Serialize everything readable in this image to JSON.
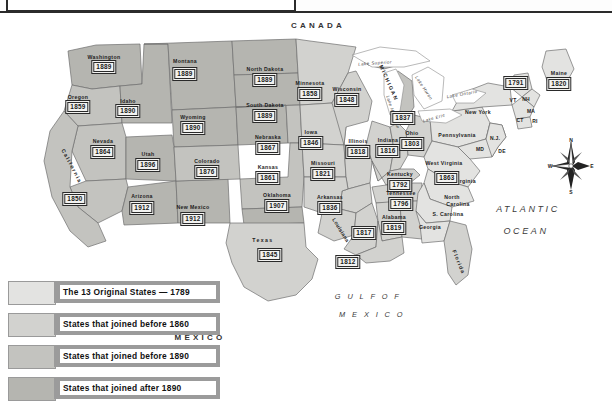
{
  "map": {
    "countries": [
      {
        "name": "CANADA",
        "x": 318,
        "y": 14
      },
      {
        "name": "MEXICO",
        "x": 200,
        "y": 326
      }
    ],
    "oceans": [
      {
        "name": "ATLANTIC",
        "x": 528,
        "y": 198
      },
      {
        "name": "OCEAN",
        "x": 526,
        "y": 220
      }
    ],
    "gulf": [
      {
        "name": "G U L F   O F",
        "x": 368,
        "y": 285
      },
      {
        "name": "M E X I C O",
        "x": 372,
        "y": 303
      }
    ],
    "lakes": [
      {
        "name": "Lake Superior",
        "x": 375,
        "y": 52,
        "rot": -4
      },
      {
        "name": "Lake Michigan",
        "x": 393,
        "y": 101,
        "rot": 72
      },
      {
        "name": "Lake Huron",
        "x": 424,
        "y": 77,
        "rot": 56
      },
      {
        "name": "Lake Erie",
        "x": 434,
        "y": 107,
        "rot": -16
      },
      {
        "name": "Lake Ontario",
        "x": 462,
        "y": 83,
        "rot": -10
      }
    ],
    "big_labels": [
      {
        "name": "MICHIGAN",
        "x": 389,
        "y": 72,
        "rot": 66
      },
      {
        "name": "California",
        "x": 72,
        "y": 155,
        "rot": 62
      },
      {
        "name": "Texas",
        "x": 263,
        "y": 229
      },
      {
        "name": "Louisiana",
        "x": 341,
        "y": 219,
        "rot": 58
      },
      {
        "name": "Florida",
        "x": 459,
        "y": 251,
        "rot": 68
      }
    ],
    "states": [
      {
        "name": "Washington",
        "date": "1889",
        "nx": 104,
        "ny": 46,
        "dx": 104,
        "dy": 56
      },
      {
        "name": "Oregon",
        "date": "1859",
        "nx": 78,
        "ny": 86,
        "dx": 78,
        "dy": 96
      },
      {
        "name": "Idaho",
        "date": "1890",
        "nx": 128,
        "ny": 90,
        "dx": 128,
        "dy": 100
      },
      {
        "name": "Montana",
        "date": "1889",
        "nx": 185,
        "ny": 50,
        "dx": 185,
        "dy": 63
      },
      {
        "name": "Wyoming",
        "date": "1890",
        "nx": 193,
        "ny": 106,
        "dx": 193,
        "dy": 117
      },
      {
        "name": "Nevada",
        "date": "1864",
        "nx": 103,
        "ny": 130,
        "dx": 103,
        "dy": 141
      },
      {
        "name": "Utah",
        "date": "1896",
        "nx": 148,
        "ny": 143,
        "dx": 148,
        "dy": 154
      },
      {
        "name": "California",
        "date": "1850",
        "nx": null,
        "ny": null,
        "dx": 75,
        "dy": 188
      },
      {
        "name": "Arizona",
        "date": "1912",
        "nx": 142,
        "ny": 185,
        "dx": 142,
        "dy": 197
      },
      {
        "name": "New Mexico",
        "date": "1912",
        "nx": 193,
        "ny": 196,
        "dx": 193,
        "dy": 208
      },
      {
        "name": "Colorado",
        "date": "1876",
        "nx": 207,
        "ny": 150,
        "dx": 207,
        "dy": 161
      },
      {
        "name": "North Dakota",
        "date": "1889",
        "nx": 265,
        "ny": 58,
        "dx": 265,
        "dy": 69
      },
      {
        "name": "South Dakota",
        "date": "1889",
        "nx": 265,
        "ny": 94,
        "dx": 265,
        "dy": 105
      },
      {
        "name": "Nebraska",
        "date": "1867",
        "nx": 268,
        "ny": 126,
        "dx": 268,
        "dy": 137
      },
      {
        "name": "Kansas",
        "date": "1861",
        "nx": 268,
        "ny": 156,
        "dx": 268,
        "dy": 167
      },
      {
        "name": "Oklahoma",
        "date": "1907",
        "nx": 277,
        "ny": 184,
        "dx": 277,
        "dy": 195
      },
      {
        "name": "Texas",
        "date": "1845",
        "nx": null,
        "ny": null,
        "dx": 270,
        "dy": 244
      },
      {
        "name": "Minnesota",
        "date": "1858",
        "nx": 310,
        "ny": 72,
        "dx": 310,
        "dy": 83
      },
      {
        "name": "Iowa",
        "date": "1846",
        "nx": 311,
        "ny": 121,
        "dx": 311,
        "dy": 132
      },
      {
        "name": "Missouri",
        "date": "1821",
        "nx": 323,
        "ny": 152,
        "dx": 323,
        "dy": 163
      },
      {
        "name": "Arkansas",
        "date": "1836",
        "nx": 330,
        "ny": 186,
        "dx": 330,
        "dy": 197
      },
      {
        "name": "Wisconsin",
        "date": "1848",
        "nx": 347,
        "ny": 78,
        "dx": 347,
        "dy": 89
      },
      {
        "name": "Illinois",
        "date": "1818",
        "nx": 358,
        "ny": 130,
        "dx": 358,
        "dy": 141
      },
      {
        "name": "Indiana",
        "date": "1816",
        "nx": 388,
        "ny": 129,
        "dx": 388,
        "dy": 140
      },
      {
        "name": "Ohio",
        "date": "1803",
        "nx": 412,
        "ny": 122,
        "dx": 412,
        "dy": 133
      },
      {
        "name": "Michigan",
        "date": "1837",
        "nx": null,
        "ny": null,
        "dx": 403,
        "dy": 107
      },
      {
        "name": "Kentucky",
        "date": "1792",
        "nx": 400,
        "ny": 163,
        "dx": 400,
        "dy": 174
      },
      {
        "name": "Tennessee",
        "date": "1796",
        "nx": 401,
        "ny": 182,
        "dx": 401,
        "dy": 193
      },
      {
        "name": "Alabama",
        "date": "1819",
        "nx": 394,
        "ny": 206,
        "dx": 394,
        "dy": 217
      },
      {
        "name": "Mississippi",
        "date": "1817",
        "nx": null,
        "ny": null,
        "dx": 364,
        "dy": 222
      },
      {
        "name": "Louisiana",
        "date": "1812",
        "nx": null,
        "ny": null,
        "dx": 348,
        "dy": 251
      },
      {
        "name": "West Virginia",
        "date": "1863",
        "nx": 444,
        "ny": 152,
        "dx": 447,
        "dy": 167
      },
      {
        "name": "Vermont",
        "date": "1791",
        "nx": null,
        "ny": null,
        "dx": 516,
        "dy": 72
      },
      {
        "name": "Maine",
        "date": "1820",
        "nx": 559,
        "ny": 62,
        "dx": 559,
        "dy": 73
      }
    ],
    "original_states": [
      {
        "name": "Pennsylvania",
        "x": 457,
        "y": 124
      },
      {
        "name": "New York",
        "x": 478,
        "y": 101
      },
      {
        "name": "Virginia",
        "x": 465,
        "y": 170
      },
      {
        "name": "North",
        "x": 452,
        "y": 186
      },
      {
        "name": "Carolina",
        "x": 458,
        "y": 193
      },
      {
        "name": "S. Carolina",
        "x": 448,
        "y": 203
      },
      {
        "name": "Georgia",
        "x": 430,
        "y": 216
      }
    ],
    "abbrevs": [
      {
        "name": "VT",
        "x": 513,
        "y": 89
      },
      {
        "name": "NH",
        "x": 526,
        "y": 88
      },
      {
        "name": "MA",
        "x": 531,
        "y": 100
      },
      {
        "name": "CT",
        "x": 520,
        "y": 109
      },
      {
        "name": "RI",
        "x": 535,
        "y": 110
      },
      {
        "name": "N.J.",
        "x": 495,
        "y": 127
      },
      {
        "name": "DE",
        "x": 502,
        "y": 140
      },
      {
        "name": "MD",
        "x": 480,
        "y": 138
      }
    ],
    "compass": {
      "n": "N",
      "s": "S",
      "e": "E",
      "w": "W"
    }
  },
  "legend": {
    "rows": [
      {
        "label": "The 13 Original States — 1789",
        "color": "#e3e3e1"
      },
      {
        "label": "States that joined before 1860",
        "color": "#d2d2cf"
      },
      {
        "label": "States that joined before 1890",
        "color": "#c3c3bf"
      },
      {
        "label": "States that joined after 1890",
        "color": "#b5b5b0"
      }
    ]
  }
}
